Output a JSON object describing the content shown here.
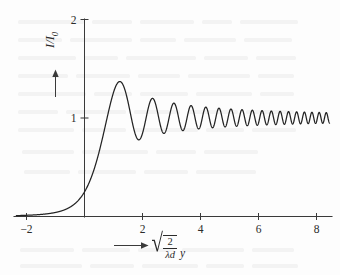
{
  "figure": {
    "background_color": "#fdfdfd",
    "ink_color": "#232323"
  },
  "axes": {
    "y_axis": {
      "label_text": "I/I",
      "label_subscript": "0",
      "arrow_icon": "arrow-up-icon",
      "ticks": [
        {
          "value": 1,
          "label": "1"
        },
        {
          "value": 2,
          "label": "2"
        }
      ],
      "range": [
        0,
        2.08
      ]
    },
    "x_axis": {
      "label_prefix_icon": "arrow-right-icon",
      "label_sqrt_numerator": "2",
      "label_sqrt_denominator": "λd",
      "label_variable": "y",
      "ticks": [
        {
          "value": -2,
          "label": "−2"
        },
        {
          "value": 2,
          "label": "2"
        },
        {
          "value": 4,
          "label": "4"
        },
        {
          "value": 6,
          "label": "6"
        },
        {
          "value": 8,
          "label": "8"
        }
      ],
      "range": [
        -2.35,
        8.45
      ]
    }
  },
  "chart_data": {
    "type": "line",
    "xlabel": "sqrt(2/(lambda d)) y",
    "ylabel": "I/I0",
    "xlim": [
      -2.35,
      8.45
    ],
    "ylim": [
      0,
      2.08
    ],
    "grid": false,
    "legend": null,
    "x_ticks": [
      -2,
      2,
      4,
      6,
      8
    ],
    "y_ticks": [
      1,
      2
    ],
    "series": [
      {
        "name": "I/I0",
        "formula": "0.5 * ((C(v) + 0.5)^2 + (S(v) + 0.5)^2)",
        "description": "Fresnel integral intensity for a straight edge; C and S are the Fresnel cosine and sine integrals of argument v.",
        "x": [
          -2.0,
          -1.8,
          -1.6,
          -1.4,
          -1.2,
          -1.0,
          -0.8,
          -0.6,
          -0.4,
          -0.2,
          0.0,
          0.2,
          0.4,
          0.6,
          0.8,
          1.0,
          1.2,
          1.4,
          1.6,
          1.8,
          2.0,
          2.2,
          2.4,
          2.6,
          2.8,
          3.0,
          3.2,
          3.4,
          3.6,
          3.8,
          4.0,
          4.2,
          4.4,
          4.6,
          4.8,
          5.0,
          5.2,
          5.4,
          5.6,
          5.8,
          6.0,
          6.2,
          6.4,
          6.6,
          6.8,
          7.0,
          7.2,
          7.4,
          7.6,
          7.8,
          8.0
        ],
        "y": [
          0.02,
          0.026,
          0.034,
          0.046,
          0.064,
          0.09,
          0.125,
          0.17,
          0.224,
          0.288,
          0.25,
          0.423,
          0.513,
          0.619,
          0.742,
          0.88,
          1.022,
          1.15,
          1.248,
          1.305,
          1.315,
          1.281,
          1.21,
          1.117,
          1.021,
          0.938,
          0.882,
          0.859,
          0.87,
          0.909,
          0.965,
          1.024,
          1.073,
          1.102,
          1.105,
          1.082,
          1.04,
          0.987,
          0.936,
          0.896,
          0.876,
          0.879,
          0.903,
          0.943,
          0.991,
          1.037,
          1.071,
          1.086,
          1.08,
          1.054,
          1.015
        ],
        "peaks": [
          {
            "x": 1.22,
            "y": 1.37
          },
          {
            "x": 2.35,
            "y": 1.2
          },
          {
            "x": 3.08,
            "y": 1.15
          },
          {
            "x": 3.7,
            "y": 1.125
          },
          {
            "x": 4.25,
            "y": 1.108
          },
          {
            "x": 4.74,
            "y": 1.095
          },
          {
            "x": 5.2,
            "y": 1.086
          },
          {
            "x": 5.62,
            "y": 1.079
          },
          {
            "x": 6.02,
            "y": 1.073
          },
          {
            "x": 6.4,
            "y": 1.068
          },
          {
            "x": 6.76,
            "y": 1.064
          },
          {
            "x": 7.11,
            "y": 1.061
          },
          {
            "x": 7.44,
            "y": 1.058
          },
          {
            "x": 7.76,
            "y": 1.055
          },
          {
            "x": 8.07,
            "y": 1.053
          }
        ],
        "minima": [
          {
            "x": 1.87,
            "y": 0.778
          },
          {
            "x": 2.74,
            "y": 0.843
          },
          {
            "x": 3.39,
            "y": 0.872
          },
          {
            "x": 3.98,
            "y": 0.89
          },
          {
            "x": 4.5,
            "y": 0.902
          },
          {
            "x": 4.98,
            "y": 0.911
          },
          {
            "x": 5.42,
            "y": 0.918
          },
          {
            "x": 5.83,
            "y": 0.924
          },
          {
            "x": 6.21,
            "y": 0.929
          },
          {
            "x": 6.58,
            "y": 0.932
          },
          {
            "x": 6.94,
            "y": 0.936
          },
          {
            "x": 7.28,
            "y": 0.939
          },
          {
            "x": 7.6,
            "y": 0.941
          },
          {
            "x": 7.92,
            "y": 0.943
          }
        ],
        "asymptote": 1.0,
        "edge_value_at_zero": 0.25
      }
    ]
  }
}
